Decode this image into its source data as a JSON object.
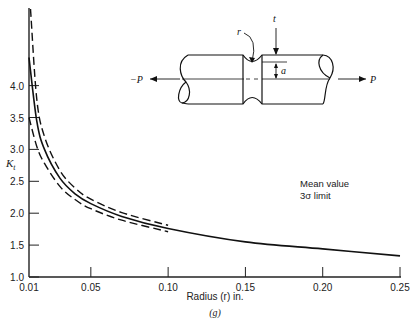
{
  "chart_data": {
    "type": "line",
    "title": "",
    "caption": "(g)",
    "xlabel": "Radius (r) in.",
    "ylabel": "Kt",
    "xlim": [
      0.01,
      0.25
    ],
    "ylim": [
      1.0,
      5.3
    ],
    "grid": false,
    "x_ticks": [
      "0.01",
      "0.05",
      "0.10",
      "0.15",
      "0.20",
      "0.25"
    ],
    "y_ticks": [
      "1.0",
      "1.5",
      "2.0",
      "2.5",
      "3.0",
      "3.5",
      "4.0"
    ],
    "legend": {
      "position": "right-middle",
      "entries": [
        "Mean value",
        "3σ limit"
      ]
    },
    "series": [
      {
        "name": "Mean value",
        "style": "solid",
        "x": [
          0.01,
          0.015,
          0.02,
          0.03,
          0.04,
          0.05,
          0.07,
          0.1,
          0.15,
          0.2,
          0.25
        ],
        "y": [
          4.44,
          3.45,
          3.0,
          2.55,
          2.3,
          2.15,
          1.95,
          1.76,
          1.55,
          1.44,
          1.33
        ]
      },
      {
        "name": "3σ limit (upper)",
        "style": "dashed",
        "x": [
          0.011,
          0.015,
          0.02,
          0.03,
          0.04,
          0.05,
          0.07,
          0.1
        ],
        "y": [
          5.2,
          3.8,
          3.2,
          2.67,
          2.39,
          2.22,
          2.01,
          1.81
        ]
      },
      {
        "name": "3σ limit (lower)",
        "style": "dashed",
        "x": [
          0.01,
          0.015,
          0.02,
          0.03,
          0.04,
          0.05,
          0.07,
          0.1
        ],
        "y": [
          3.5,
          3.05,
          2.78,
          2.42,
          2.21,
          2.07,
          1.89,
          1.71
        ]
      }
    ]
  },
  "diagram": {
    "labels": {
      "r": "r",
      "t": "t",
      "a": "a",
      "left_load": "−P",
      "right_load": "P"
    }
  }
}
